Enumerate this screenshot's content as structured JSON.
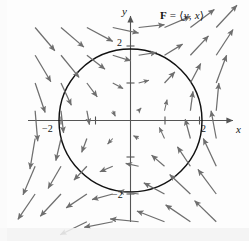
{
  "figure": {
    "width": 249,
    "height": 241
  },
  "labels": {
    "field_label_lead": "F",
    "field_label_eq": " = ",
    "field_label_open": "⟨",
    "field_label_first": "y",
    "field_label_comma": ", ",
    "field_label_second": "x",
    "field_label_close": "⟩",
    "y_axis": "y",
    "x_axis": "x",
    "tick_y_positive": "2",
    "tick_y_negative": "−2",
    "tick_x_positive": "2",
    "tick_x_negative": "−2"
  },
  "colors": {
    "arrow": "#6e6e6e",
    "axis": "#555555",
    "circle": "#111111",
    "background": "#fdfdfd",
    "text": "#151515"
  },
  "chart_data": {
    "type": "scatter",
    "title": "F = ⟨y, x⟩",
    "xlabel": "x",
    "ylabel": "y",
    "xlim": [
      -3.0,
      3.1
    ],
    "ylim": [
      -3.2,
      3.2
    ],
    "grid": false,
    "legend": null,
    "field": {
      "formula_x_component": "y",
      "formula_y_component": "x",
      "sample_step": 0.75,
      "sample_range_x": [
        -2.75,
        2.75
      ],
      "sample_range_y": [
        -2.75,
        2.75
      ],
      "arrow_scale": 0.3,
      "max_arrow_length_units": 0.85,
      "description": "At each sample point (x, y) an arrow is drawn in the direction <y, x>; quadrant I arrows point up-right, quadrant II down-right, quadrant III down-left, quadrant IV up-left."
    },
    "overlays": [
      {
        "kind": "circle",
        "center": [
          0,
          0
        ],
        "radius": 2,
        "stroke": "#111111",
        "stroke_width": 1.4,
        "fill": "none"
      }
    ],
    "axes": {
      "x_axis_y_value": 0,
      "y_axis_x_value": 0,
      "x_ticks": [
        -2,
        -1,
        1,
        2
      ],
      "y_ticks": [
        -2,
        -1,
        1,
        2
      ],
      "labeled_x_ticks": [
        -2,
        2
      ],
      "labeled_y_ticks": [
        -2,
        2
      ],
      "arrowheads": [
        "x-positive",
        "y-positive"
      ]
    },
    "pixel_mapping": {
      "origin_px": [
        130,
        120
      ],
      "units_per_px_x": 34.5,
      "units_per_px_y": 37.0
    }
  }
}
